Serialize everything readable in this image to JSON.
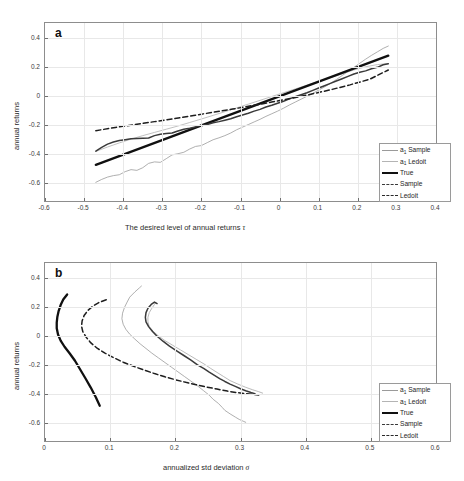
{
  "figure": {
    "panels": [
      {
        "label": "a",
        "xlabel_prefix": "The desired level of annual returns ",
        "xlabel_symbol": "τ",
        "ylabel": "annual returns",
        "xticks": [
          "-0.6",
          "-0.5",
          "-0.4",
          "-0.3",
          "-0.2",
          "-0.1",
          "0",
          "0.1",
          "0.2",
          "0.3",
          "0.4"
        ],
        "yticks": [
          "0.4",
          "0.2",
          "0",
          "-0.2",
          "-0.4",
          "-0.6"
        ]
      },
      {
        "label": "b",
        "xlabel_prefix": "annualized std deviation ",
        "xlabel_symbol": "σ",
        "ylabel": "annual returns",
        "xticks": [
          "0",
          "0.1",
          "0.2",
          "0.3",
          "0.4",
          "0.5",
          "0.6"
        ],
        "yticks": [
          "0.4",
          "0.2",
          "0",
          "-0.2",
          "-0.4",
          "-0.6"
        ]
      }
    ],
    "legend_entries": [
      {
        "label_main": "a",
        "label_sub": "1",
        "label_rest": " Sample",
        "style": "thin-solid",
        "color": "#9a9a9a"
      },
      {
        "label_main": "a",
        "label_sub": "1",
        "label_rest": " Ledoit",
        "style": "thin-solid",
        "color": "#b4b4b4"
      },
      {
        "label_main": "True",
        "label_sub": "",
        "label_rest": "",
        "style": "thick-solid",
        "color": "#101010"
      },
      {
        "label_main": "Sample",
        "label_sub": "",
        "label_rest": "",
        "style": "medium-dashdot",
        "color": "#3a3a3a"
      },
      {
        "label_main": "Ledoit",
        "label_sub": "",
        "label_rest": "",
        "style": "dash-dot",
        "color": "#2a2a2a"
      }
    ]
  },
  "chart_data": [
    {
      "type": "line",
      "panel": "a",
      "title": "",
      "xlabel": "The desired level of annual returns τ",
      "ylabel": "annual returns",
      "xlim": [
        -0.6,
        0.4
      ],
      "ylim": [
        -0.72,
        0.5
      ],
      "xticks": [
        -0.6,
        -0.5,
        -0.4,
        -0.3,
        -0.2,
        -0.1,
        0,
        0.1,
        0.2,
        0.3,
        0.4
      ],
      "yticks": [
        0.4,
        0.2,
        0,
        -0.2,
        -0.4,
        -0.6
      ],
      "grid": true,
      "legend_position": "lower-right",
      "series": [
        {
          "name": "a_1 Sample",
          "style": "thin-solid",
          "color": "#9a9a9a",
          "x": [
            -0.47,
            -0.455,
            -0.44,
            -0.425,
            -0.41,
            -0.395,
            -0.38,
            -0.365,
            -0.35,
            -0.335,
            -0.32,
            -0.305,
            -0.29,
            -0.275,
            -0.26,
            -0.245,
            -0.23,
            -0.215,
            -0.2,
            -0.185,
            -0.17,
            -0.155,
            -0.14,
            -0.125,
            -0.11,
            -0.095,
            -0.08,
            -0.065,
            -0.05,
            -0.035,
            -0.02,
            -0.005,
            0.01,
            0.025,
            0.04,
            0.055,
            0.07,
            0.085,
            0.1,
            0.115,
            0.13,
            0.145,
            0.16,
            0.175,
            0.19,
            0.205,
            0.22,
            0.235,
            0.25,
            0.265,
            0.278
          ],
          "y": [
            -0.592,
            -0.572,
            -0.556,
            -0.546,
            -0.54,
            -0.519,
            -0.505,
            -0.51,
            -0.492,
            -0.462,
            -0.452,
            -0.455,
            -0.43,
            -0.404,
            -0.396,
            -0.386,
            -0.364,
            -0.346,
            -0.34,
            -0.32,
            -0.3,
            -0.287,
            -0.272,
            -0.254,
            -0.232,
            -0.214,
            -0.196,
            -0.178,
            -0.16,
            -0.14,
            -0.122,
            -0.104,
            -0.084,
            -0.062,
            -0.042,
            -0.022,
            -0.002,
            0.018,
            0.04,
            0.062,
            0.086,
            0.112,
            0.14,
            0.168,
            0.196,
            0.224,
            0.252,
            0.278,
            0.302,
            0.326,
            0.342
          ]
        },
        {
          "name": "a_1 Ledoit",
          "style": "thin-solid",
          "color": "#b0b0b0",
          "x": [
            -0.47,
            -0.44,
            -0.41,
            -0.38,
            -0.35,
            -0.32,
            -0.29,
            -0.26,
            -0.23,
            -0.2,
            -0.17,
            -0.14,
            -0.11,
            -0.08,
            -0.05,
            -0.02,
            0.01,
            0.04,
            0.07,
            0.1,
            0.13,
            0.16,
            0.19,
            0.22,
            0.25,
            0.278
          ],
          "y": [
            -0.38,
            -0.35,
            -0.322,
            -0.296,
            -0.272,
            -0.25,
            -0.228,
            -0.206,
            -0.182,
            -0.158,
            -0.133,
            -0.108,
            -0.082,
            -0.056,
            -0.03,
            -0.004,
            0.022,
            0.048,
            0.074,
            0.1,
            0.126,
            0.152,
            0.178,
            0.2,
            0.215,
            0.222
          ]
        },
        {
          "name": "True",
          "style": "thick-solid",
          "color": "#101010",
          "x": [
            -0.47,
            0.278
          ],
          "y": [
            -0.472,
            0.276
          ]
        },
        {
          "name": "Sample",
          "style": "medium-noisy",
          "color": "#3a3a3a",
          "x": [
            -0.47,
            -0.455,
            -0.44,
            -0.425,
            -0.41,
            -0.395,
            -0.38,
            -0.365,
            -0.35,
            -0.335,
            -0.32,
            -0.305,
            -0.29,
            -0.275,
            -0.26,
            -0.245,
            -0.23,
            -0.215,
            -0.2,
            -0.185,
            -0.17,
            -0.155,
            -0.14,
            -0.125,
            -0.11,
            -0.095,
            -0.08,
            -0.065,
            -0.05,
            -0.035,
            -0.02,
            -0.005,
            0.01,
            0.025,
            0.04,
            0.055,
            0.07,
            0.085,
            0.1,
            0.115,
            0.13,
            0.145,
            0.16,
            0.175,
            0.19,
            0.205,
            0.22,
            0.235,
            0.25,
            0.265,
            0.278
          ],
          "y": [
            -0.378,
            -0.352,
            -0.33,
            -0.316,
            -0.306,
            -0.3,
            -0.294,
            -0.292,
            -0.29,
            -0.288,
            -0.272,
            -0.262,
            -0.258,
            -0.254,
            -0.24,
            -0.228,
            -0.222,
            -0.212,
            -0.2,
            -0.196,
            -0.184,
            -0.176,
            -0.166,
            -0.156,
            -0.142,
            -0.13,
            -0.118,
            -0.104,
            -0.092,
            -0.076,
            -0.064,
            -0.05,
            -0.036,
            -0.02,
            -0.006,
            0.008,
            0.022,
            0.038,
            0.054,
            0.07,
            0.086,
            0.102,
            0.118,
            0.134,
            0.15,
            0.162,
            0.172,
            0.186,
            0.196,
            0.214,
            0.22
          ]
        },
        {
          "name": "Ledoit",
          "style": "dashed",
          "color": "#1e1e1e",
          "x": [
            -0.47,
            -0.42,
            -0.37,
            -0.32,
            -0.27,
            -0.22,
            -0.17,
            -0.12,
            -0.07,
            -0.02,
            0.03,
            0.08,
            0.13,
            0.18,
            0.23,
            0.278
          ],
          "y": [
            -0.238,
            -0.216,
            -0.196,
            -0.176,
            -0.156,
            -0.134,
            -0.112,
            -0.09,
            -0.066,
            -0.042,
            -0.016,
            0.012,
            0.042,
            0.076,
            0.114,
            0.178
          ]
        }
      ]
    },
    {
      "type": "line",
      "panel": "b",
      "title": "",
      "xlabel": "annualized std deviation σ",
      "ylabel": "annual returns",
      "xlim": [
        0,
        0.6
      ],
      "ylim": [
        -0.72,
        0.5
      ],
      "xticks": [
        0,
        0.1,
        0.2,
        0.3,
        0.4,
        0.5,
        0.6
      ],
      "yticks": [
        0.4,
        0.2,
        0,
        -0.2,
        -0.4,
        -0.6
      ],
      "grid": true,
      "legend_position": "lower-right",
      "series": [
        {
          "name": "a_1 Sample",
          "style": "thin-solid",
          "color": "#9a9a9a",
          "x": [
            0.148,
            0.145,
            0.138,
            0.13,
            0.126,
            0.122,
            0.119,
            0.118,
            0.12,
            0.124,
            0.13,
            0.138,
            0.146,
            0.155,
            0.164,
            0.174,
            0.184,
            0.194,
            0.204,
            0.214,
            0.224,
            0.234,
            0.243,
            0.252,
            0.258,
            0.266,
            0.272,
            0.276,
            0.284,
            0.292,
            0.298,
            0.304,
            0.308
          ],
          "y": [
            0.342,
            0.33,
            0.302,
            0.266,
            0.232,
            0.196,
            0.156,
            0.118,
            0.08,
            0.046,
            0.012,
            -0.022,
            -0.054,
            -0.086,
            -0.118,
            -0.15,
            -0.182,
            -0.214,
            -0.246,
            -0.278,
            -0.31,
            -0.342,
            -0.374,
            -0.406,
            -0.434,
            -0.462,
            -0.49,
            -0.51,
            -0.534,
            -0.556,
            -0.572,
            -0.584,
            -0.592
          ]
        },
        {
          "name": "a_1 Ledoit",
          "style": "thin-solid",
          "color": "#a8a8a8",
          "x": [
            0.17,
            0.168,
            0.164,
            0.16,
            0.158,
            0.158,
            0.16,
            0.166,
            0.174,
            0.184,
            0.196,
            0.208,
            0.22,
            0.232,
            0.244,
            0.254,
            0.264,
            0.274,
            0.284,
            0.296,
            0.308,
            0.318,
            0.328,
            0.334
          ],
          "y": [
            0.228,
            0.216,
            0.19,
            0.16,
            0.128,
            0.096,
            0.064,
            0.032,
            0.0,
            -0.032,
            -0.064,
            -0.096,
            -0.128,
            -0.16,
            -0.192,
            -0.222,
            -0.25,
            -0.278,
            -0.306,
            -0.33,
            -0.352,
            -0.368,
            -0.382,
            -0.392
          ]
        },
        {
          "name": "True",
          "style": "thick-solid",
          "color": "#101010",
          "x": [
            0.034,
            0.028,
            0.024,
            0.021,
            0.019,
            0.018,
            0.018,
            0.02,
            0.024,
            0.03,
            0.038,
            0.046,
            0.054,
            0.062,
            0.07,
            0.078,
            0.084
          ],
          "y": [
            0.284,
            0.25,
            0.212,
            0.172,
            0.132,
            0.092,
            0.052,
            0.01,
            -0.032,
            -0.074,
            -0.12,
            -0.17,
            -0.23,
            -0.29,
            -0.352,
            -0.42,
            -0.478
          ]
        },
        {
          "name": "Sample",
          "style": "medium-noisy",
          "color": "#3a3a3a",
          "x": [
            0.172,
            0.168,
            0.163,
            0.158,
            0.155,
            0.154,
            0.155,
            0.159,
            0.165,
            0.172,
            0.181,
            0.191,
            0.202,
            0.213,
            0.224,
            0.234,
            0.244,
            0.252,
            0.26,
            0.268,
            0.276,
            0.284,
            0.292,
            0.3,
            0.308,
            0.316,
            0.322
          ],
          "y": [
            0.222,
            0.232,
            0.216,
            0.19,
            0.16,
            0.128,
            0.096,
            0.064,
            0.03,
            -0.002,
            -0.036,
            -0.07,
            -0.102,
            -0.134,
            -0.166,
            -0.198,
            -0.224,
            -0.248,
            -0.27,
            -0.292,
            -0.312,
            -0.33,
            -0.346,
            -0.362,
            -0.376,
            -0.388,
            -0.396
          ]
        },
        {
          "name": "Ledoit",
          "style": "dashed",
          "color": "#1e1e1e",
          "x": [
            0.094,
            0.084,
            0.074,
            0.066,
            0.06,
            0.057,
            0.056,
            0.058,
            0.063,
            0.07,
            0.08,
            0.092,
            0.106,
            0.12,
            0.136,
            0.152,
            0.168,
            0.184,
            0.2,
            0.216,
            0.232,
            0.248,
            0.264,
            0.28,
            0.294,
            0.308,
            0.318,
            0.328
          ],
          "y": [
            0.248,
            0.232,
            0.206,
            0.176,
            0.14,
            0.104,
            0.068,
            0.03,
            -0.008,
            -0.046,
            -0.084,
            -0.118,
            -0.15,
            -0.18,
            -0.208,
            -0.234,
            -0.258,
            -0.28,
            -0.3,
            -0.318,
            -0.334,
            -0.35,
            -0.364,
            -0.378,
            -0.388,
            -0.396,
            -0.4,
            -0.404
          ]
        }
      ]
    }
  ]
}
